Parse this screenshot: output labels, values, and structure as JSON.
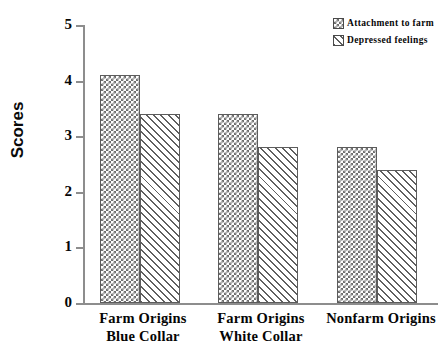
{
  "chart_data": {
    "type": "bar",
    "title": "",
    "xlabel": "",
    "ylabel": "Scores",
    "ylim": [
      0,
      5
    ],
    "yticks": [
      "0",
      "1",
      "2",
      "3",
      "4",
      "5"
    ],
    "grid": false,
    "legend_position": "top-right",
    "categories": [
      "Farm Origins Blue Collar",
      "Farm Origins White Collar",
      "Nonfarm Origins"
    ],
    "category_lines": [
      {
        "line1": "Farm Origins",
        "line2": "Blue Collar"
      },
      {
        "line1": "Farm Origins",
        "line2": "White Collar"
      },
      {
        "line1": "Nonfarm Origins",
        "line2": ""
      }
    ],
    "series": [
      {
        "name": "Attachment to farm",
        "pattern": "crosshatch",
        "values": [
          4.1,
          3.4,
          2.8
        ]
      },
      {
        "name": "Depressed feelings",
        "pattern": "diagonal-hatch",
        "values": [
          3.4,
          2.8,
          2.4
        ]
      }
    ]
  },
  "legend": {
    "items": [
      {
        "label": "Attachment to farm",
        "swatch": "crosshatch-swatch"
      },
      {
        "label": "Depressed feelings",
        "swatch": "diagonal-hatch-swatch"
      }
    ]
  },
  "axis": {
    "y_title": "Scores",
    "y_tick_labels": [
      "5",
      "4",
      "3",
      "2",
      "1",
      "0"
    ]
  },
  "colors": {
    "axis": "#8d8d8d",
    "bar_outline": "#5c5c5c",
    "hatch": "#6e6e6e",
    "text": "#060606",
    "background": "#ffffff"
  }
}
